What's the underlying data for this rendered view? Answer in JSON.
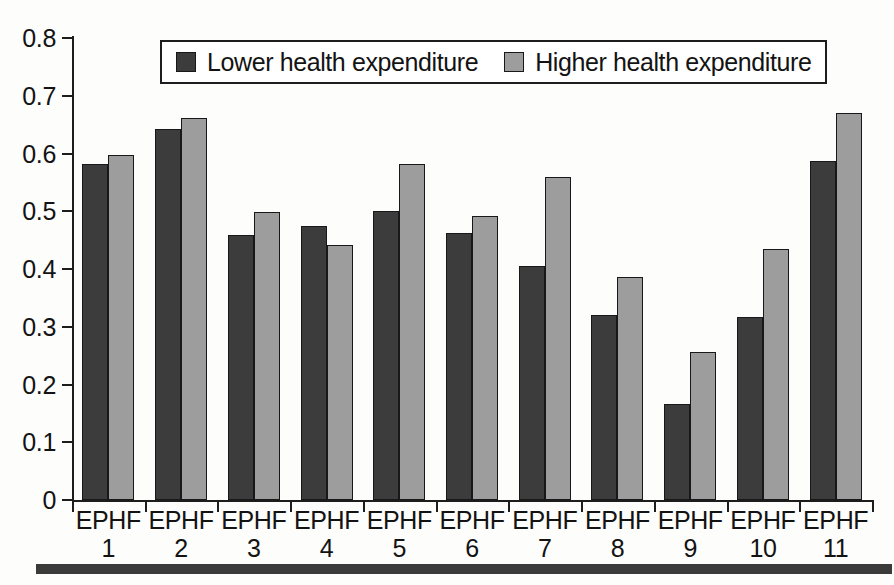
{
  "chart_data": {
    "type": "bar",
    "title": "",
    "subtitle": "",
    "xlabel": "",
    "ylabel": "",
    "ylim": [
      0,
      0.8
    ],
    "yticks": [
      "0",
      "0.1",
      "0.2",
      "0.3",
      "0.4",
      "0.5",
      "0.6",
      "0.7",
      "0.8"
    ],
    "ytick_values": [
      0,
      0.1,
      0.2,
      0.3,
      0.4,
      0.5,
      0.6,
      0.7,
      0.8
    ],
    "grid": false,
    "legend_position": "top-center",
    "categories": [
      "EPHF 1",
      "EPHF 2",
      "EPHF 3",
      "EPHF 4",
      "EPHF 5",
      "EPHF 6",
      "EPHF 7",
      "EPHF 8",
      "EPHF 9",
      "EPHF 10",
      "EPHF 11"
    ],
    "category_lines": [
      {
        "l1": "EPHF",
        "l2": "1"
      },
      {
        "l1": "EPHF",
        "l2": "2"
      },
      {
        "l1": "EPHF",
        "l2": "3"
      },
      {
        "l1": "EPHF",
        "l2": "4"
      },
      {
        "l1": "EPHF",
        "l2": "5"
      },
      {
        "l1": "EPHF",
        "l2": "6"
      },
      {
        "l1": "EPHF",
        "l2": "7"
      },
      {
        "l1": "EPHF",
        "l2": "8"
      },
      {
        "l1": "EPHF",
        "l2": "9"
      },
      {
        "l1": "EPHF",
        "l2": "10"
      },
      {
        "l1": "EPHF",
        "l2": "11"
      }
    ],
    "series": [
      {
        "name": "Lower health expenditure",
        "color": "#3c3c3c",
        "values": [
          0.582,
          0.642,
          0.459,
          0.474,
          0.501,
          0.462,
          0.406,
          0.32,
          0.167,
          0.317,
          0.587
        ]
      },
      {
        "name": "Higher health expenditure",
        "color": "#9d9d9d",
        "values": [
          0.598,
          0.661,
          0.498,
          0.442,
          0.581,
          0.491,
          0.56,
          0.386,
          0.257,
          0.434,
          0.67
        ]
      }
    ]
  },
  "legend": {
    "entries": [
      {
        "label": "Lower health expenditure",
        "swatch": "lower"
      },
      {
        "label": "Higher health expenditure",
        "swatch": "higher"
      }
    ]
  },
  "colors": {
    "lower": "#3c3c3c",
    "higher": "#9d9d9d",
    "axis": "#1d1d1d",
    "rule": "#3b3b3b",
    "background": "#fdfdfc"
  }
}
